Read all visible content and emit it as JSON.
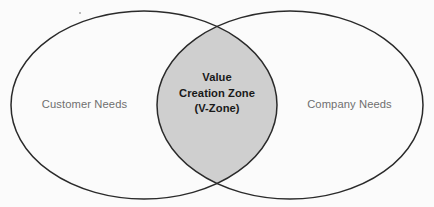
{
  "diagram": {
    "type": "venn-two-set",
    "background_color": "#fbfbfb",
    "stroke_color": "#2a2a2a",
    "overlap_fill_color": "#cfcfcf",
    "side_label_color": "#6f6f6f",
    "center_label_color": "#191919",
    "left_set": {
      "label": "Customer Needs",
      "center_x": 144,
      "center_y": 105,
      "radius_x": 133,
      "radius_y": 94
    },
    "right_set": {
      "label": "Company Needs",
      "center_x": 290,
      "center_y": 105,
      "radius_x": 133,
      "radius_y": 94
    },
    "intersection": {
      "lines": [
        "Value",
        "Creation Zone",
        "(V-Zone)"
      ],
      "left_edge_x": 157,
      "right_edge_x": 277,
      "top_crossing_y": 30,
      "bottom_crossing_y": 183
    }
  }
}
